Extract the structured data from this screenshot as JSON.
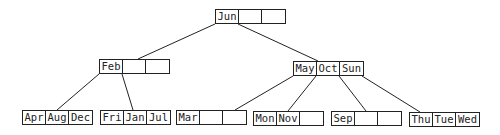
{
  "diagram": {
    "type": "b-tree",
    "nodes": [
      {
        "id": "root",
        "keys": [
          "Jun",
          "",
          ""
        ],
        "x": 215,
        "y": 9
      },
      {
        "id": "feb",
        "keys": [
          "Feb",
          "",
          ""
        ],
        "x": 99,
        "y": 59
      },
      {
        "id": "may",
        "keys": [
          "May",
          "Oct",
          "Sun"
        ],
        "x": 293,
        "y": 61
      },
      {
        "id": "apr",
        "keys": [
          "Apr",
          "Aug",
          "Dec"
        ],
        "x": 22,
        "y": 110
      },
      {
        "id": "fri",
        "keys": [
          "Fri",
          "Jan",
          "Jul"
        ],
        "x": 100,
        "y": 110
      },
      {
        "id": "mar",
        "keys": [
          "Mar",
          "",
          ""
        ],
        "x": 176,
        "y": 110
      },
      {
        "id": "mon",
        "keys": [
          "Mon",
          "Nov",
          ""
        ],
        "x": 253,
        "y": 111
      },
      {
        "id": "sep",
        "keys": [
          "Sep",
          "",
          ""
        ],
        "x": 331,
        "y": 111
      },
      {
        "id": "thu",
        "keys": [
          "Thu",
          "Tue",
          "Wed"
        ],
        "x": 409,
        "y": 112
      }
    ],
    "edges": [
      {
        "from": "root",
        "to": "feb"
      },
      {
        "from": "root",
        "to": "may"
      },
      {
        "from": "feb",
        "to": "apr"
      },
      {
        "from": "feb",
        "to": "fri"
      },
      {
        "from": "may",
        "to": "mar"
      },
      {
        "from": "may",
        "to": "mon"
      },
      {
        "from": "may",
        "to": "sep"
      },
      {
        "from": "may",
        "to": "thu"
      }
    ]
  }
}
